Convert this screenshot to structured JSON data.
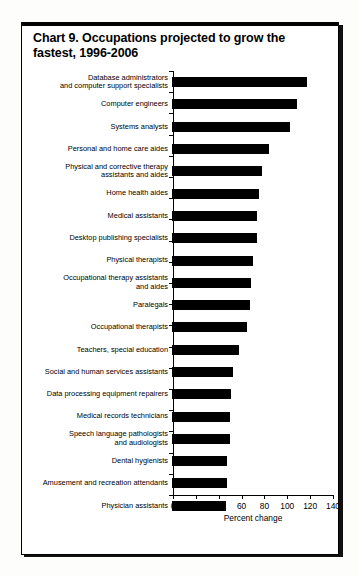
{
  "chart_data": {
    "type": "bar",
    "orientation": "horizontal",
    "title": "Chart 9. Occupations projected to grow the fastest, 1996-2006",
    "xlabel": "Percent change",
    "ylabel": "",
    "xlim": [
      0,
      140
    ],
    "xticks": [
      0,
      20,
      40,
      60,
      80,
      100,
      120,
      140
    ],
    "grid": false,
    "legend": null,
    "bar_color": "#000000",
    "categories": [
      "Database administrators\nand computer support specialists",
      "Computer engineers",
      "Systems analysts",
      "Personal and home care aides",
      "Physical and corrective therapy\nassistants and aides",
      "Home health aides",
      "Medical assistants",
      "Desktop publishing specialists",
      "Physical therapists",
      "Occupational therapy assistants\nand aides",
      "Paralegals",
      "Occupational therapists",
      "Teachers, special education",
      "Social and human services assistants",
      "Data processing equipment repairers",
      "Medical records technicians",
      "Speech language pathologists\nand audiologists",
      "Dental hygienists",
      "Amusement and recreation attendants",
      "Physician assistants"
    ],
    "values": [
      118,
      109,
      103,
      85,
      79,
      76,
      74,
      74,
      71,
      69,
      68,
      66,
      59,
      53,
      52,
      51,
      51,
      48,
      48,
      47
    ]
  },
  "axis": {
    "tick_labels": [
      "0",
      "20",
      "40",
      "60",
      "80",
      "100",
      "120",
      "140"
    ],
    "title": "Percent change"
  }
}
